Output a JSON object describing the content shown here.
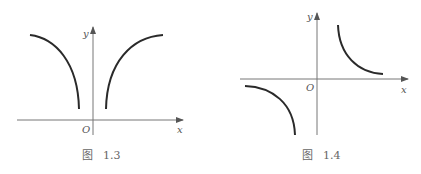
{
  "figures": [
    {
      "caption_prefix": "图",
      "caption_number": "1.3",
      "axis_labels": {
        "x": "x",
        "y": "y",
        "origin": "O"
      },
      "description": "Two curves symmetric about the y-axis, both above the x-axis; left curve rises from near the y-axis toward upper left, right curve rises from near the y-axis toward upper right"
    },
    {
      "caption_prefix": "图",
      "caption_number": "1.4",
      "axis_labels": {
        "x": "x",
        "y": "y",
        "origin": "O"
      },
      "description": "Hyperbola-like curves in the first and third quadrants, symmetric about the origin"
    }
  ]
}
